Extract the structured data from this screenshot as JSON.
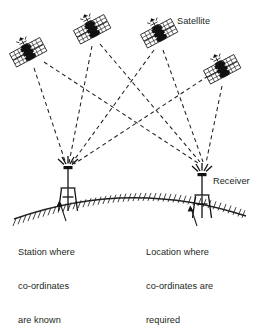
{
  "diagram": {
    "type": "schematic-diagram",
    "background_color": "#ffffff",
    "ink_color": "#231f20",
    "labels": {
      "satellite": "Satellite",
      "receiver": "Receiver",
      "station_block": {
        "line1": "Station where",
        "line2": "co-ordinates",
        "line3": "are known"
      },
      "location_block": {
        "line1": "Location where",
        "line2": "co-ordinates are",
        "line3": "required"
      }
    },
    "satellites": [
      {
        "id": "satellite-1",
        "name": "satellite-icon-1",
        "x": 28,
        "y": 52,
        "rotation": -28
      },
      {
        "id": "satellite-2",
        "name": "satellite-icon-2",
        "x": 92,
        "y": 28,
        "rotation": -28
      },
      {
        "id": "satellite-3",
        "name": "satellite-icon-3",
        "x": 159,
        "y": 32,
        "rotation": -28
      },
      {
        "id": "satellite-4",
        "name": "satellite-icon-4",
        "x": 222,
        "y": 68,
        "rotation": -28
      }
    ],
    "receivers": [
      {
        "id": "receiver-left",
        "name": "reference-station-tower",
        "x": 68,
        "apex_y": 168,
        "base_y": 196
      },
      {
        "id": "receiver-right",
        "name": "rover-receiver-tower",
        "x": 202,
        "apex_y": 168,
        "base_y": 205
      }
    ],
    "signal_paths": [
      {
        "from": "satellite-1",
        "to": "receiver-left"
      },
      {
        "from": "satellite-1",
        "to": "receiver-right"
      },
      {
        "from": "satellite-2",
        "to": "receiver-left"
      },
      {
        "from": "satellite-2",
        "to": "receiver-right"
      },
      {
        "from": "satellite-3",
        "to": "receiver-left"
      },
      {
        "from": "satellite-3",
        "to": "receiver-right"
      },
      {
        "from": "satellite-4",
        "to": "receiver-left"
      },
      {
        "from": "satellite-4",
        "to": "receiver-right"
      }
    ],
    "ground": {
      "name": "earth-surface-arc",
      "style": "curved hatched terrain line",
      "left_end": {
        "x": 14,
        "y": 219
      },
      "apex": {
        "x": 130,
        "y": 190
      },
      "right_end": {
        "x": 246,
        "y": 216
      }
    },
    "leaders": [
      {
        "id": "leader-station",
        "from": {
          "x": 65,
          "y": 218
        },
        "to": {
          "x": 60,
          "y": 201
        }
      },
      {
        "id": "leader-location",
        "from": {
          "x": 196,
          "y": 222
        },
        "to": {
          "x": 192,
          "y": 207
        }
      }
    ]
  }
}
